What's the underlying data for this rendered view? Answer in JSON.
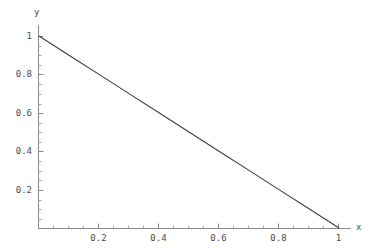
{
  "chart_data": {
    "type": "line",
    "title": "",
    "xlabel": "x",
    "ylabel": "y",
    "xlim": [
      0,
      1.06
    ],
    "ylim": [
      0,
      1.04
    ],
    "grid": false,
    "legend": null,
    "line_color": "#3c3c3c",
    "axis_color": "#8a8a8a",
    "background_color": "#ffffff",
    "text_color": "#4a4a4a",
    "series": [
      {
        "name": "y = 1 - x",
        "x": [
          0,
          0.1,
          0.2,
          0.3,
          0.4,
          0.5,
          0.6,
          0.7,
          0.8,
          0.9,
          1
        ],
        "values": [
          1,
          0.9,
          0.8,
          0.7,
          0.6,
          0.5,
          0.4,
          0.3,
          0.2,
          0.1,
          0
        ]
      }
    ],
    "x_ticks": [
      {
        "value": 0.2,
        "label": "0.2"
      },
      {
        "value": 0.4,
        "label": "0.4"
      },
      {
        "value": 0.6,
        "label": "0.6"
      },
      {
        "value": 0.8,
        "label": "0.8"
      },
      {
        "value": 1.0,
        "label": "1"
      }
    ],
    "y_ticks": [
      {
        "value": 0.2,
        "label": "0.2"
      },
      {
        "value": 0.4,
        "label": "0.4"
      },
      {
        "value": 0.6,
        "label": "0.6"
      },
      {
        "value": 0.8,
        "label": "0.8"
      },
      {
        "value": 1.0,
        "label": "1"
      }
    ],
    "x_minor_ticks": [
      0.05,
      0.1,
      0.15,
      0.25,
      0.3,
      0.35,
      0.45,
      0.5,
      0.55,
      0.65,
      0.7,
      0.75,
      0.85,
      0.9,
      0.95,
      1.05
    ],
    "y_minor_ticks": [
      0.05,
      0.1,
      0.15,
      0.25,
      0.3,
      0.35,
      0.45,
      0.5,
      0.55,
      0.65,
      0.7,
      0.75,
      0.85,
      0.9,
      0.95
    ]
  },
  "axes": {
    "x_name": "x",
    "y_name": "y"
  },
  "y_tick_labels": {
    "t1": "1",
    "t08": "0.8",
    "t06": "0.6",
    "t04": "0.4",
    "t02": "0.2"
  },
  "x_tick_labels": {
    "t02": "0.2",
    "t04": "0.4",
    "t06": "0.6",
    "t08": "0.8",
    "t1": "1"
  }
}
